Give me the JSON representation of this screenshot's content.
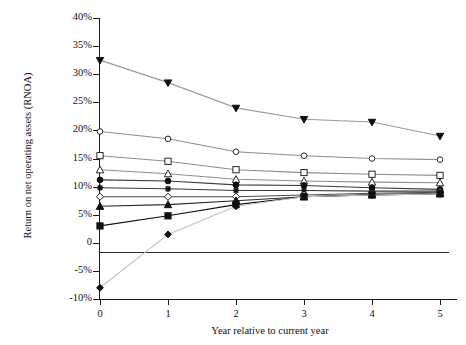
{
  "top_caption": "",
  "chart_data": {
    "type": "line",
    "title": "",
    "xlabel": "Year relative to current year",
    "ylabel": "Return on net operating assets (RNOA)",
    "x": [
      0,
      1,
      2,
      3,
      4,
      5
    ],
    "xtick_labels": [
      "0",
      "1",
      "2",
      "3",
      "4",
      "5"
    ],
    "ytick_labels": [
      "40%",
      "35%",
      "30%",
      "25%",
      "20%",
      "15%",
      "10%",
      "5%",
      "0",
      "-5%",
      "-10%"
    ],
    "ytick_values": [
      40,
      35,
      30,
      25,
      20,
      15,
      10,
      5,
      0,
      -5,
      -10
    ],
    "xlim": [
      0,
      5
    ],
    "ylim": [
      -10,
      40
    ],
    "grid": false,
    "legend": "none",
    "zero_line": true,
    "series": [
      {
        "name": "portfolio-1-highest",
        "marker": "filled-down-triangle",
        "color": "#9a9a9a",
        "marker_color": "#101010",
        "values": [
          32.5,
          28.5,
          24.0,
          22.0,
          21.5,
          19.0
        ]
      },
      {
        "name": "portfolio-2",
        "marker": "open-circle",
        "color": "#8e8e8e",
        "marker_color": "#101010",
        "values": [
          19.8,
          18.5,
          16.2,
          15.5,
          15.0,
          14.8
        ]
      },
      {
        "name": "portfolio-3",
        "marker": "open-square",
        "color": "#8e8e8e",
        "marker_color": "#101010",
        "values": [
          15.5,
          14.5,
          13.0,
          12.5,
          12.2,
          12.0
        ]
      },
      {
        "name": "portfolio-4",
        "marker": "open-triangle",
        "color": "#8e8e8e",
        "marker_color": "#101010",
        "values": [
          13.0,
          12.3,
          11.3,
          11.0,
          10.8,
          10.7
        ]
      },
      {
        "name": "portfolio-5",
        "marker": "filled-circle",
        "color": "#3a3a3a",
        "marker_color": "#101010",
        "values": [
          11.2,
          11.0,
          10.3,
          10.2,
          9.8,
          9.5
        ]
      },
      {
        "name": "portfolio-6",
        "marker": "cross",
        "color": "#3a3a3a",
        "marker_color": "#101010",
        "values": [
          9.8,
          9.6,
          9.3,
          9.3,
          9.2,
          9.2
        ]
      },
      {
        "name": "portfolio-7",
        "marker": "open-diamond",
        "color": "#4a4a4a",
        "marker_color": "#101010",
        "values": [
          8.2,
          8.2,
          8.2,
          8.5,
          8.8,
          9.0
        ]
      },
      {
        "name": "portfolio-8",
        "marker": "filled-up-triangle",
        "color": "#2a2a2a",
        "marker_color": "#101010",
        "values": [
          6.5,
          6.8,
          7.5,
          8.2,
          8.6,
          8.8
        ]
      },
      {
        "name": "portfolio-9",
        "marker": "filled-square",
        "color": "#101010",
        "marker_color": "#101010",
        "values": [
          3.0,
          4.8,
          6.8,
          8.2,
          8.5,
          8.7
        ]
      },
      {
        "name": "portfolio-10-lowest",
        "marker": "filled-diamond",
        "color": "#c2c2c2",
        "marker_color": "#101010",
        "values": [
          -8.0,
          1.5,
          6.5,
          8.2,
          8.5,
          8.7
        ]
      }
    ]
  }
}
